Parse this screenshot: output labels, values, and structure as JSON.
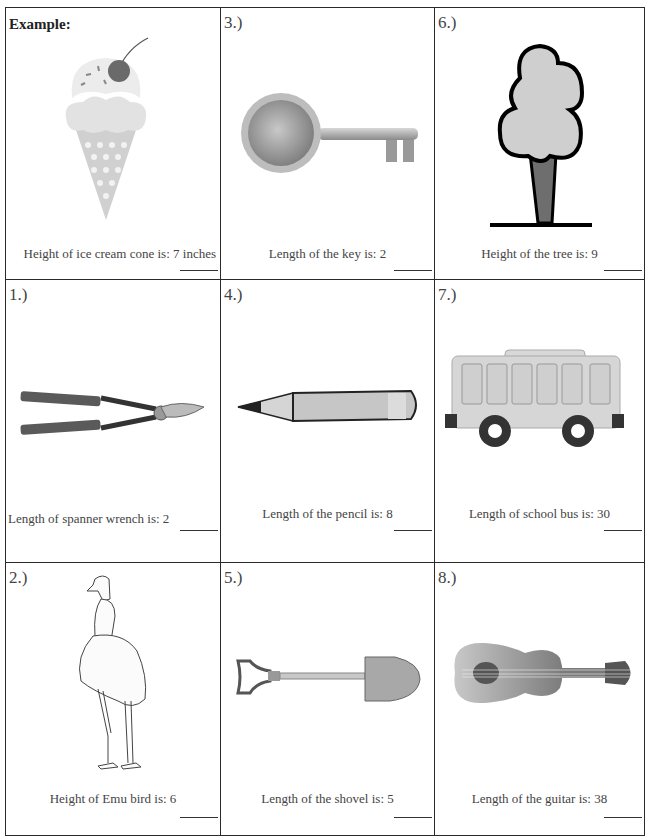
{
  "worksheet": {
    "cells": [
      {
        "id": "example",
        "number": "Example:",
        "label": "Height of ice cream cone is: 7 inches",
        "object": "ice-cream-cone",
        "measure": "Height",
        "value": "7",
        "unit": "inches"
      },
      {
        "id": "q3",
        "number": "3.)",
        "label": "Length of the key is: 2",
        "object": "key",
        "measure": "Length",
        "value": "2"
      },
      {
        "id": "q6",
        "number": "6.)",
        "label": "Height of the tree is: 9",
        "object": "tree",
        "measure": "Height",
        "value": "9"
      },
      {
        "id": "q1",
        "number": "1.)",
        "label": "Length of spanner wrench is: 2",
        "object": "loppers",
        "measure": "Length",
        "value": "2"
      },
      {
        "id": "q4",
        "number": "4.)",
        "label": "Length of the pencil is: 8",
        "object": "pencil",
        "measure": "Length",
        "value": "8"
      },
      {
        "id": "q7",
        "number": "7.)",
        "label": "Length of school bus is: 30",
        "object": "school-bus",
        "measure": "Length",
        "value": "30"
      },
      {
        "id": "q2",
        "number": "2.)",
        "label": "Height of Emu bird  is: 6",
        "object": "emu",
        "measure": "Height",
        "value": "6"
      },
      {
        "id": "q5",
        "number": "5.)",
        "label": "Length of the shovel is: 5",
        "object": "shovel",
        "measure": "Length",
        "value": "5"
      },
      {
        "id": "q8",
        "number": "8.)",
        "label": "Length of the guitar is: 38",
        "object": "guitar",
        "measure": "Length",
        "value": "38"
      }
    ]
  }
}
